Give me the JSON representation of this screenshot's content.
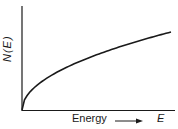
{
  "chart_data": {
    "type": "line",
    "title": "",
    "xlabel": "Energy",
    "xlabel_arrow": "→",
    "xvariable": "E",
    "ylabel": "N(E)",
    "grid": false,
    "legend": null,
    "axis_ticks": false,
    "x": [
      0,
      0.02,
      0.05,
      0.1,
      0.2,
      0.3,
      0.4,
      0.5,
      0.6,
      0.7,
      0.8,
      0.9,
      1.0
    ],
    "series": [
      {
        "name": "N(E)",
        "shape": "sqrt",
        "values": [
          0,
          0.14,
          0.22,
          0.32,
          0.45,
          0.55,
          0.63,
          0.71,
          0.77,
          0.84,
          0.89,
          0.95,
          1.0
        ]
      }
    ],
    "xlim": [
      0,
      1.05
    ],
    "ylim": [
      0,
      1.2
    ]
  },
  "colors": {
    "line": "#1a1a1a",
    "axes": "#1a1a1a",
    "background": "#ffffff"
  }
}
